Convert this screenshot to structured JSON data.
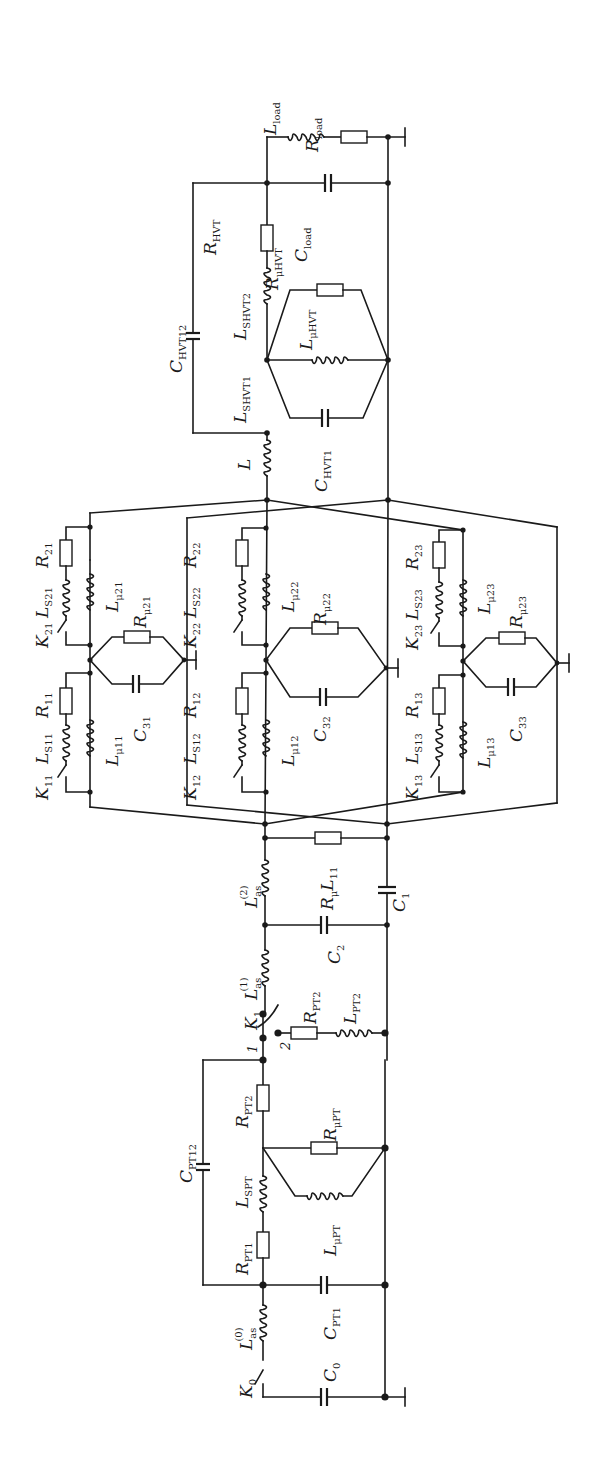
{
  "figure": {
    "type": "circuit-schematic",
    "orientation": "rotated-90-ccw",
    "stroke_color": "#1a1a1a",
    "background": "#ffffff"
  },
  "labels": {
    "L_load": {
      "main": "L",
      "sub": "load"
    },
    "R_load": {
      "main": "R",
      "sub": "load"
    },
    "C_load": {
      "main": "C",
      "sub": "load"
    },
    "R_HVT": {
      "main": "R",
      "sub": "HVT"
    },
    "R_muHVT": {
      "main": "R",
      "sub": "μHVT"
    },
    "L_SHVT2": {
      "main": "L",
      "sub": "SHVT2"
    },
    "C_HVT12": {
      "main": "C",
      "sub": "HVT12"
    },
    "L_muHVT": {
      "main": "L",
      "sub": "μHVT"
    },
    "L_SHVT1": {
      "main": "L",
      "sub": "SHVT1"
    },
    "C_HVT1": {
      "main": "C",
      "sub": "HVT1"
    },
    "L": {
      "main": "L",
      "sub": ""
    },
    "K21": {
      "main": "K",
      "sub": "21"
    },
    "L_S21": {
      "main": "L",
      "sub": "S21"
    },
    "R21": {
      "main": "R",
      "sub": "21"
    },
    "L_mu21": {
      "main": "L",
      "sub": "μ21"
    },
    "R_mu21": {
      "main": "R",
      "sub": "μ21"
    },
    "K11": {
      "main": "K",
      "sub": "11"
    },
    "L_S11": {
      "main": "L",
      "sub": "S11"
    },
    "R11": {
      "main": "R",
      "sub": "11"
    },
    "L_mu11": {
      "main": "L",
      "sub": "μ11"
    },
    "C31": {
      "main": "C",
      "sub": "31"
    },
    "K22": {
      "main": "K",
      "sub": "22"
    },
    "L_S22": {
      "main": "L",
      "sub": "S22"
    },
    "R22": {
      "main": "R",
      "sub": "22"
    },
    "L_mu22": {
      "main": "L",
      "sub": "μ22"
    },
    "R_mu22": {
      "main": "R",
      "sub": "μ22"
    },
    "K12": {
      "main": "K",
      "sub": "12"
    },
    "L_S12": {
      "main": "L",
      "sub": "S12"
    },
    "R12": {
      "main": "R",
      "sub": "12"
    },
    "L_mu12": {
      "main": "L",
      "sub": "μ12"
    },
    "C32": {
      "main": "C",
      "sub": "32"
    },
    "K23": {
      "main": "K",
      "sub": "23"
    },
    "L_S23": {
      "main": "L",
      "sub": "S23"
    },
    "R23": {
      "main": "R",
      "sub": "23"
    },
    "L_mu23": {
      "main": "L",
      "sub": "μ23"
    },
    "R_mu23": {
      "main": "R",
      "sub": "μ23"
    },
    "K13": {
      "main": "K",
      "sub": "13"
    },
    "L_S13": {
      "main": "L",
      "sub": "S13"
    },
    "R13": {
      "main": "R",
      "sub": "13"
    },
    "L_mu13": {
      "main": "L",
      "sub": "μ13"
    },
    "C33": {
      "main": "C",
      "sub": "33"
    },
    "L_as2": {
      "main": "L",
      "sub": "as",
      "sup": "(2)"
    },
    "R_muL11": {
      "main": "R",
      "sub": "μ",
      "tail": "L",
      "tail_sub": "11"
    },
    "C1": {
      "main": "C",
      "sub": "1"
    },
    "C2": {
      "main": "C",
      "sub": "2"
    },
    "L_as1": {
      "main": "L",
      "sub": "as",
      "sup": "(1)"
    },
    "K1": {
      "main": "K",
      "sub": "1"
    },
    "K1_pos1": "1",
    "K1_pos2": "2",
    "R_PT2_branch": {
      "main": "R",
      "sub": "PT2"
    },
    "L_PT2": {
      "main": "L",
      "sub": "PT2"
    },
    "C_PT12": {
      "main": "C",
      "sub": "PT12"
    },
    "R_PT2": {
      "main": "R",
      "sub": "PT2"
    },
    "R_muPT": {
      "main": "R",
      "sub": "μPT"
    },
    "L_SPT": {
      "main": "L",
      "sub": "SPT"
    },
    "L_muPT": {
      "main": "L",
      "sub": "μPT"
    },
    "R_PT1": {
      "main": "R",
      "sub": "PT1"
    },
    "C_PT1": {
      "main": "C",
      "sub": "PT1"
    },
    "L_as0": {
      "main": "L",
      "sub": "as",
      "sup": "(0)"
    },
    "K0": {
      "main": "K",
      "sub": "0"
    },
    "C0": {
      "main": "C",
      "sub": "0"
    }
  }
}
